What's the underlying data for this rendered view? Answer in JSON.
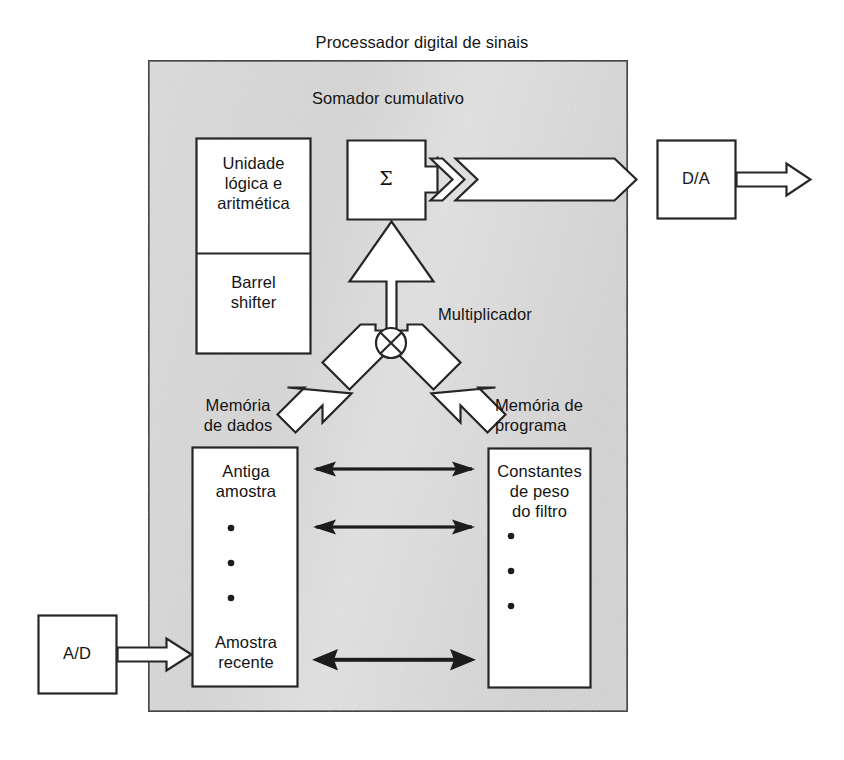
{
  "diagram": {
    "title": "Processador digital de sinais",
    "panel": {
      "label": "Somador cumulativo",
      "fill_color": "#d8d8d8",
      "border_color": "#2a2a2a"
    },
    "blocks": {
      "alu": "Unidade\nlógica e\naritmética",
      "barrel_shifter": "Barrel\nshifter",
      "accumulator_symbol": "Σ",
      "multiplier_symbol": "⊗",
      "multiplier_label": "Multiplicador",
      "data_memory_label": "Memória\nde dados",
      "program_memory_label": "Memória de\nprograma",
      "data_memory_top": "Antiga\namostra",
      "data_memory_bottom": "Amostra\nrecente",
      "program_memory_top": "Constantes\nde peso\ndo filtro",
      "adc": "A/D",
      "dac": "D/A"
    },
    "colors": {
      "stroke": "#262626",
      "panel_fill": "#d8d8d8",
      "box_fill": "#ffffff"
    }
  }
}
